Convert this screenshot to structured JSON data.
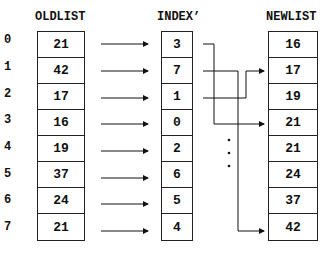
{
  "headers": {
    "oldlist": "OLDLIST",
    "index": "INDEX’",
    "newlist": "NEWLIST"
  },
  "row_indices": [
    "0",
    "1",
    "2",
    "3",
    "4",
    "5",
    "6",
    "7"
  ],
  "oldlist": [
    "21",
    "42",
    "17",
    "16",
    "19",
    "37",
    "24",
    "21"
  ],
  "index": [
    "3",
    "7",
    "1",
    "0",
    "2",
    "6",
    "5",
    "4"
  ],
  "newlist": [
    "16",
    "17",
    "19",
    "21",
    "21",
    "24",
    "37",
    "42"
  ],
  "ellipsis": "⋮",
  "connectors": [
    {
      "from_index_row": 0,
      "to_newlist_row": 3
    },
    {
      "from_index_row": 1,
      "to_newlist_row": 7
    },
    {
      "from_index_row": 2,
      "to_newlist_row": 1
    }
  ]
}
